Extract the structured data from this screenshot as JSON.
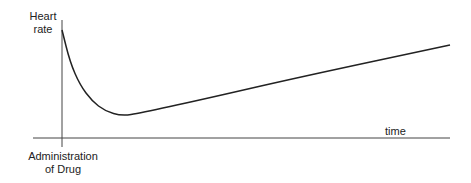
{
  "chart_data": {
    "type": "line",
    "title": "",
    "xlabel": "time",
    "ylabel": "Heart rate",
    "annotations": [
      "Administration of Drug"
    ],
    "grid": false,
    "points_px": [
      [
        62,
        30
      ],
      [
        70,
        62
      ],
      [
        80,
        85
      ],
      [
        92,
        101
      ],
      [
        105,
        111
      ],
      [
        122,
        116
      ],
      [
        140,
        113
      ],
      [
        200,
        100
      ],
      [
        300,
        77
      ],
      [
        450,
        45
      ]
    ]
  },
  "labels": {
    "y_line1": "Heart",
    "y_line2": "rate",
    "x": "time",
    "event_line1": "Administration",
    "event_line2": "of Drug"
  }
}
